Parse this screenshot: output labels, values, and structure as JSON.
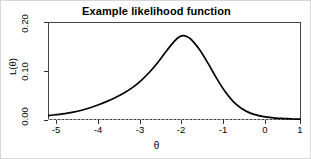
{
  "chart_data": {
    "type": "line",
    "title": "Example likelihood function",
    "xlabel": "θ",
    "ylabel": "L(θ)",
    "xlim": [
      -5,
      1
    ],
    "ylim": [
      0,
      0.2
    ],
    "grid": false,
    "legend": null,
    "xticks": [
      "-5",
      "-4",
      "-3",
      "-2",
      "-1",
      "0",
      "1"
    ],
    "xtick_values": [
      -5,
      -4,
      -3,
      -2,
      -1,
      0,
      1
    ],
    "yticks": [
      "0.00",
      "0.10",
      "0.20"
    ],
    "ytick_values": [
      0.0,
      0.1,
      0.2
    ],
    "series": [
      {
        "name": "L(θ)",
        "color": "#000000",
        "x": [
          -5.0,
          -4.8,
          -4.6,
          -4.4,
          -4.2,
          -4.0,
          -3.8,
          -3.6,
          -3.4,
          -3.2,
          -3.0,
          -2.8,
          -2.6,
          -2.4,
          -2.2,
          -2.0,
          -1.9,
          -1.8,
          -1.7,
          -1.6,
          -1.4,
          -1.2,
          -1.0,
          -0.8,
          -0.6,
          -0.4,
          -0.2,
          0.0,
          0.2,
          0.4,
          0.6,
          0.8,
          1.0
        ],
        "values": [
          0.009,
          0.011,
          0.013,
          0.016,
          0.02,
          0.025,
          0.031,
          0.038,
          0.046,
          0.055,
          0.066,
          0.08,
          0.097,
          0.117,
          0.14,
          0.161,
          0.169,
          0.172,
          0.17,
          0.164,
          0.143,
          0.115,
          0.085,
          0.058,
          0.037,
          0.023,
          0.014,
          0.009,
          0.006,
          0.004,
          0.003,
          0.002,
          0.002
        ]
      }
    ],
    "baseline": {
      "y": 0.0,
      "color": "#cccccc",
      "style": "dotted"
    },
    "peak": {
      "x": -1.8,
      "y": 0.172
    }
  }
}
